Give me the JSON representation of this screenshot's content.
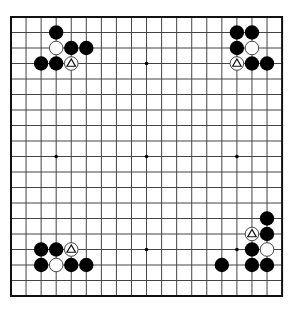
{
  "board": {
    "size": 19,
    "origin_x": 11,
    "origin_y": 17,
    "spacing_x": 15.06,
    "spacing_y": 15.5,
    "stone_radius": 7.2,
    "colors": {
      "background": "#ffffff",
      "grid_line": "#444444",
      "border": "#111111",
      "black_stone": "#000000",
      "white_stone": "#ffffff",
      "white_outline": "#333333",
      "marker": "#111111"
    },
    "star_points": [
      [
        3,
        3
      ],
      [
        9,
        3
      ],
      [
        15,
        3
      ],
      [
        3,
        9
      ],
      [
        9,
        9
      ],
      [
        15,
        9
      ],
      [
        3,
        15
      ],
      [
        9,
        15
      ],
      [
        15,
        15
      ]
    ]
  },
  "stones": [
    {
      "color": "black",
      "col": 3,
      "row": 1
    },
    {
      "color": "white",
      "col": 3,
      "row": 2
    },
    {
      "color": "black",
      "col": 4,
      "row": 2
    },
    {
      "color": "black",
      "col": 5,
      "row": 2
    },
    {
      "color": "black",
      "col": 2,
      "row": 3
    },
    {
      "color": "black",
      "col": 3,
      "row": 3
    },
    {
      "color": "white",
      "col": 4,
      "row": 3,
      "marker": "triangle"
    },
    {
      "color": "black",
      "col": 15,
      "row": 1
    },
    {
      "color": "black",
      "col": 16,
      "row": 1
    },
    {
      "color": "black",
      "col": 15,
      "row": 2
    },
    {
      "color": "white",
      "col": 16,
      "row": 2
    },
    {
      "color": "white",
      "col": 15,
      "row": 3,
      "marker": "triangle"
    },
    {
      "color": "black",
      "col": 16,
      "row": 3
    },
    {
      "color": "black",
      "col": 17,
      "row": 3
    },
    {
      "color": "black",
      "col": 2,
      "row": 15
    },
    {
      "color": "black",
      "col": 3,
      "row": 15
    },
    {
      "color": "white",
      "col": 4,
      "row": 15,
      "marker": "triangle"
    },
    {
      "color": "black",
      "col": 2,
      "row": 16
    },
    {
      "color": "white",
      "col": 3,
      "row": 16
    },
    {
      "color": "black",
      "col": 4,
      "row": 16
    },
    {
      "color": "black",
      "col": 5,
      "row": 16
    },
    {
      "color": "black",
      "col": 17,
      "row": 13
    },
    {
      "color": "white",
      "col": 16,
      "row": 14,
      "marker": "triangle"
    },
    {
      "color": "black",
      "col": 17,
      "row": 14
    },
    {
      "color": "black",
      "col": 16,
      "row": 15
    },
    {
      "color": "white",
      "col": 17,
      "row": 15
    },
    {
      "color": "black",
      "col": 14,
      "row": 16
    },
    {
      "color": "black",
      "col": 16,
      "row": 16
    },
    {
      "color": "black",
      "col": 17,
      "row": 16
    }
  ]
}
